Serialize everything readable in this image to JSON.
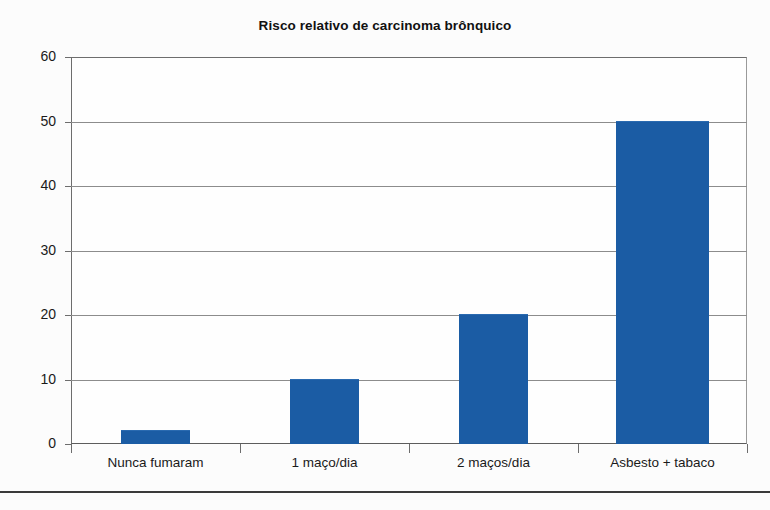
{
  "chart_data": {
    "type": "bar",
    "title": "Risco relativo de carcinoma brônquico",
    "subtitle": "",
    "xlabel": "",
    "ylabel": "",
    "categories": [
      "Nunca fumaram",
      "1 maço/dia",
      "2 maços/dia",
      "Asbesto + tabaco"
    ],
    "values": [
      2,
      10,
      20,
      50
    ],
    "series": [
      {
        "name": "Risco relativo",
        "values": [
          2,
          10,
          20,
          50
        ]
      }
    ],
    "ylim": [
      0,
      60
    ],
    "yticks": [
      0,
      10,
      20,
      30,
      40,
      50,
      60
    ],
    "ytick_labels": [
      "0",
      "10",
      "20",
      "30",
      "40",
      "50",
      "60"
    ],
    "grid": true,
    "grid_axis": "y",
    "legend": false,
    "legend_position": "none",
    "bar_color": "#1b5ca4",
    "gridline_color": "#8c8c8c",
    "axis_color": "#5c5c5c",
    "background_color": "#fcfcfc",
    "annotations": []
  }
}
